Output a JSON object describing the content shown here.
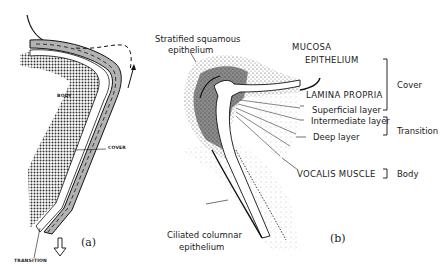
{
  "panel_a": {
    "tag": "(a)",
    "labels": {
      "body": "BODY",
      "cover": "COVER",
      "transition": "TRANSITION"
    }
  },
  "panel_b": {
    "tag": "(b)",
    "labels": {
      "stratified_1": "Stratified squamous",
      "stratified_2": "epithelium",
      "mucosa": "MUCOSA",
      "epithelium": "EPITHELIUM",
      "lamina_propria": "LAMINA PROPRIA",
      "superficial": "Superficial layer",
      "intermediate": "Intermediate layer",
      "deep": "Deep layer",
      "vocalis": "VOCALIS MUSCLE",
      "ciliated_1": "Ciliated columnar",
      "ciliated_2": "epithelium"
    },
    "brackets": {
      "cover": "Cover",
      "transition": "Transition",
      "body": "Body"
    }
  },
  "colors": {
    "ink": "#1a1a1a",
    "stipple": "#555555",
    "background": "#ffffff"
  }
}
